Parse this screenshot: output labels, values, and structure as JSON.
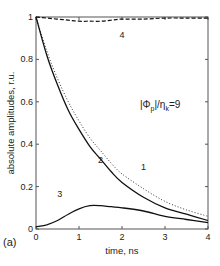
{
  "chart_data": {
    "type": "line",
    "panel_label": "(a)",
    "annotation": "|Φp|/ηk=9",
    "annotation_parts": {
      "main": "|Φ",
      "sub1": "p",
      "mid": "|/η",
      "sub2": "k",
      "tail": "=9"
    },
    "xlabel": "time, ns",
    "ylabel": "absolute amplitudes, r.u.",
    "xlim": [
      0,
      4
    ],
    "ylim": [
      0,
      1
    ],
    "xticks": [
      "0",
      "1",
      "2",
      "3",
      "4"
    ],
    "yticks": [
      "0",
      "0.2",
      "0.4",
      "0.6",
      "0.8",
      "1"
    ],
    "grid": false,
    "x": [
      0,
      0.25,
      0.5,
      0.75,
      1.0,
      1.25,
      1.5,
      1.75,
      2.0,
      2.5,
      3.0,
      3.5,
      4.0
    ],
    "series": [
      {
        "name": "1",
        "style": "dotted",
        "values": [
          1.0,
          0.84,
          0.71,
          0.6,
          0.51,
          0.43,
          0.37,
          0.31,
          0.26,
          0.19,
          0.13,
          0.09,
          0.06
        ]
      },
      {
        "name": "2",
        "style": "solid",
        "values": [
          1.0,
          0.82,
          0.68,
          0.56,
          0.47,
          0.39,
          0.33,
          0.27,
          0.22,
          0.15,
          0.1,
          0.07,
          0.04
        ]
      },
      {
        "name": "3",
        "style": "solid",
        "values": [
          0.01,
          0.02,
          0.04,
          0.07,
          0.095,
          0.11,
          0.11,
          0.105,
          0.1,
          0.085,
          0.06,
          0.045,
          0.03
        ]
      },
      {
        "name": "4",
        "style": "dashed",
        "values": [
          1.0,
          0.995,
          0.99,
          0.985,
          0.98,
          0.98,
          0.98,
          0.985,
          0.99,
          0.99,
          0.995,
          0.995,
          0.995
        ]
      }
    ],
    "curve_labels": [
      {
        "text": "1",
        "x": 2.5,
        "y": 0.28
      },
      {
        "text": "2",
        "x": 1.5,
        "y": 0.31
      },
      {
        "text": "3",
        "x": 0.55,
        "y": 0.15
      },
      {
        "text": "4",
        "x": 2.0,
        "y": 0.9
      }
    ]
  }
}
